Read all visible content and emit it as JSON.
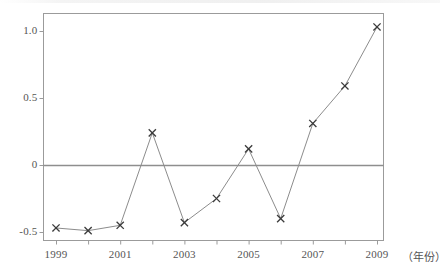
{
  "chart_data": {
    "type": "line",
    "title": "",
    "subtitle": "",
    "xlabel": "（年份）",
    "ylabel": "",
    "x": [
      1999,
      2000,
      2001,
      2002,
      2003,
      2004,
      2005,
      2006,
      2007,
      2008,
      2009
    ],
    "values": [
      -0.47,
      -0.49,
      -0.45,
      0.24,
      -0.43,
      -0.25,
      0.12,
      -0.4,
      0.31,
      0.59,
      1.03
    ],
    "series": [
      {
        "name": "",
        "values": [
          -0.47,
          -0.49,
          -0.45,
          0.24,
          -0.43,
          -0.25,
          0.12,
          -0.4,
          0.31,
          0.59,
          1.03
        ]
      }
    ],
    "xlim": [
      1999,
      2009
    ],
    "ylim": [
      -0.56,
      1.13
    ],
    "x_tick_labels": [
      "1999",
      "2001",
      "2003",
      "2005",
      "2007",
      "2009"
    ],
    "x_tick_values": [
      1999,
      2001,
      2003,
      2005,
      2007,
      2009
    ],
    "x_minor_tick_values": [
      2000,
      2002,
      2004,
      2006,
      2008
    ],
    "y_tick_labels": [
      "1.0",
      "0.5",
      "0",
      "-0.5"
    ],
    "y_tick_values": [
      1.0,
      0.5,
      0.0,
      -0.5
    ],
    "grid": false,
    "zero_line": true,
    "legend": null,
    "marker": "x",
    "annotations": []
  },
  "axes": {
    "x_caption": "（年份）"
  },
  "style": {
    "line_color": "#8c8c8c",
    "marker_color": "#3a3a3a",
    "frame_color": "#9b9b9b",
    "zero_line_color": "#8e8e8e",
    "text_color": "#555555",
    "background": "#ffffff"
  }
}
